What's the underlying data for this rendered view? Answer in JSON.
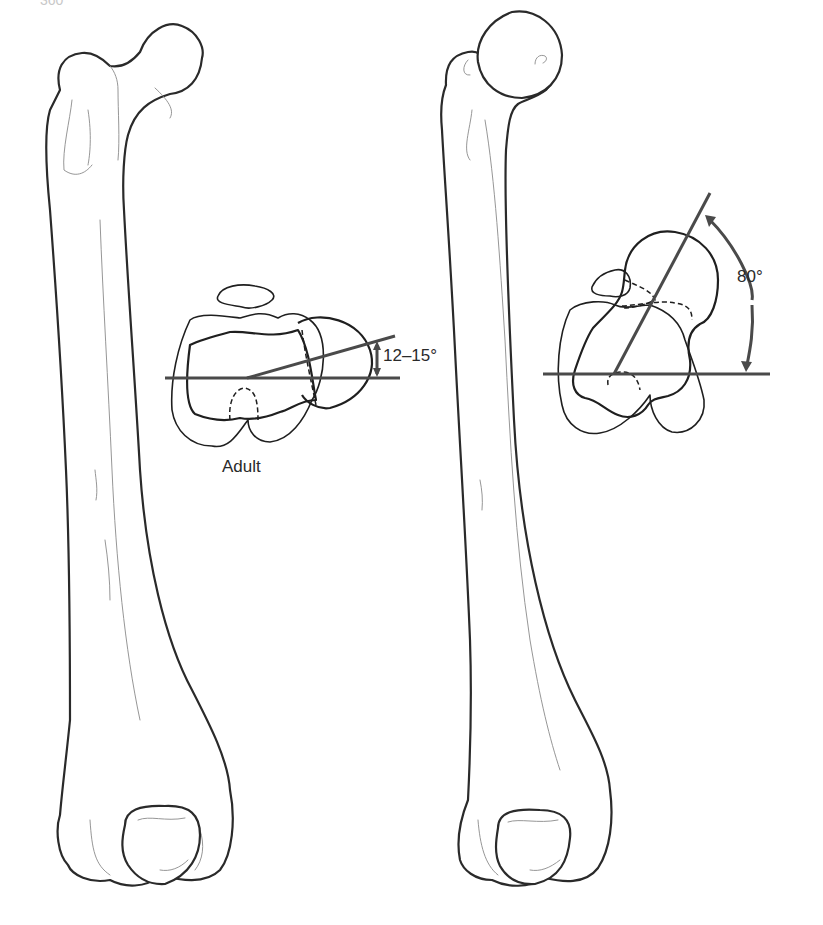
{
  "figure": {
    "page_number": "360",
    "left_panel": {
      "subject": "Adult femur (anterior view)",
      "section_label": "Adult",
      "angle_label": "12–15°",
      "angle_degrees_range": [
        12,
        15
      ]
    },
    "right_panel": {
      "subject": "Femur with increased anteversion (anterior view)",
      "angle_label": "80°",
      "angle_degrees": 80
    },
    "colors": {
      "outline": "#2a2a2a",
      "angle_lines": "#4a4a4a",
      "background": "#ffffff"
    }
  }
}
